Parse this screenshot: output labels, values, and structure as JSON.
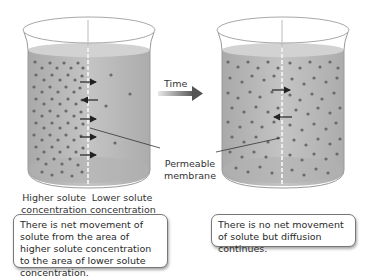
{
  "diagram": {
    "time_label": "Time",
    "membrane_label_line1": "Permeable",
    "membrane_label_line2": "membrane",
    "left_beaker": {
      "left_label_line1": "Higher solute",
      "left_label_line2": "concentration",
      "right_label_line1": "Lower solute",
      "right_label_line2": "concentration",
      "caption": "There is net movement of solute from the area of higher solute concentration to the area of lower solute concentration."
    },
    "right_beaker": {
      "caption": "There is no net movement of solute but diffusion continues."
    },
    "colors": {
      "liquid": "#b9b9b9",
      "liquid_top": "#cfcfcf",
      "particle": "#6a6a6a",
      "arrow": "#222222",
      "time_arrow": "#6e6e6e",
      "glass_edge": "#9a9a9a"
    }
  }
}
